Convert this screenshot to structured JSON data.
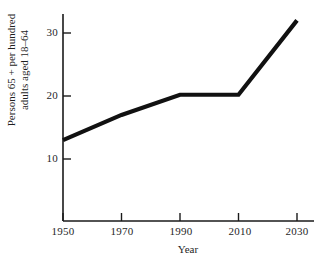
{
  "chart_data": {
    "type": "line",
    "title": "",
    "subtitle": "",
    "xlabel": "Year",
    "ylabel": "Persons 65 + per hundred adults aged 18–64",
    "ylabel_lines": [
      "Persons 65 + per hundred",
      "adults aged 18–64"
    ],
    "x": [
      1950,
      1970,
      1990,
      2010,
      2030
    ],
    "values": [
      13,
      17,
      20.2,
      20.2,
      32
    ],
    "xticks": [
      "1950",
      "1970",
      "1990",
      "2010",
      "2030"
    ],
    "xtick_values": [
      1950,
      1970,
      1990,
      2010,
      2030
    ],
    "yticks": [
      "10",
      "20",
      "30"
    ],
    "ytick_values": [
      10,
      20,
      30
    ],
    "xlim": [
      1950,
      2035
    ],
    "ylim": [
      0,
      33.5
    ],
    "grid": false,
    "legend": false,
    "line_color": "#111111",
    "axis_color": "#1a1a1a",
    "background_color": "#ffffff"
  },
  "axes": {
    "x_axis_name": "year-axis",
    "y_axis_name": "persons-axis"
  }
}
